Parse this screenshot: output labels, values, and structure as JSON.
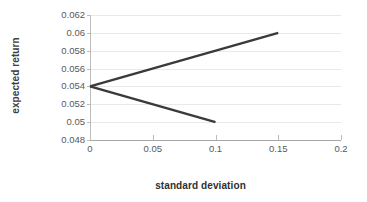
{
  "chart_data": {
    "type": "line",
    "title": "",
    "subtitle": "",
    "xlabel": "standard deviation",
    "ylabel": "expected return",
    "xlim": [
      0,
      0.2
    ],
    "ylim": [
      0.048,
      0.062
    ],
    "xticks": [
      "0",
      "0.05",
      "0.1",
      "0.15",
      "0.2"
    ],
    "xtick_values": [
      0,
      0.05,
      0.1,
      0.15,
      0.2
    ],
    "yticks": [
      "0.048",
      "0.05",
      "0.052",
      "0.054",
      "0.056",
      "0.058",
      "0.06",
      "0.062"
    ],
    "ytick_values": [
      0.048,
      0.05,
      0.052,
      0.054,
      0.056,
      0.058,
      0.06,
      0.062
    ],
    "grid": "horizontal",
    "legend": "none",
    "series": [
      {
        "name": "efficient-frontier-upper",
        "x": [
          0,
          0.15
        ],
        "y": [
          0.054,
          0.06
        ],
        "color": "#3a3a3a",
        "width": 2.4
      },
      {
        "name": "efficient-frontier-lower",
        "x": [
          0,
          0.1
        ],
        "y": [
          0.054,
          0.05
        ],
        "color": "#3a3a3a",
        "width": 2.4
      }
    ],
    "annotations": []
  },
  "style": {
    "line_color": "#3a3a3a",
    "grid_color": "#e9e9ea",
    "axis_color": "#a6a6a6",
    "tick_label_color": "#58595b",
    "axis_title_color": "#303030",
    "background": "#ffffff"
  }
}
